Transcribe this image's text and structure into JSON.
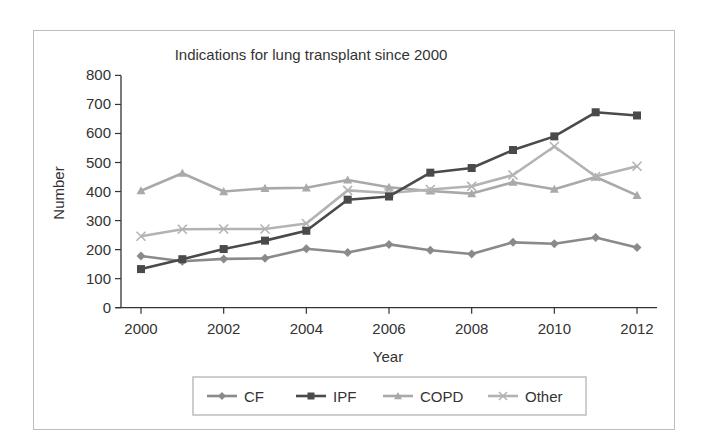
{
  "chart_data": {
    "type": "line",
    "title": "Indications for lung transplant since 2000",
    "xlabel": "Year",
    "ylabel": "Number",
    "x": [
      2000,
      2001,
      2002,
      2003,
      2004,
      2005,
      2006,
      2007,
      2008,
      2009,
      2010,
      2011,
      2012
    ],
    "x_tick_labels": [
      "2000",
      "2002",
      "2004",
      "2006",
      "2008",
      "2010",
      "2012"
    ],
    "y_tick_labels": [
      "0",
      "100",
      "200",
      "300",
      "400",
      "500",
      "600",
      "700",
      "800"
    ],
    "ylim": [
      0,
      800
    ],
    "xlim": [
      2000,
      2012
    ],
    "grid": false,
    "legend_position": "bottom",
    "series": [
      {
        "name": "CF",
        "marker": "diamond",
        "color": "#8a8a8a",
        "values": [
          178,
          160,
          168,
          170,
          203,
          190,
          218,
          198,
          185,
          225,
          220,
          242,
          207
        ]
      },
      {
        "name": "IPF",
        "marker": "square",
        "color": "#4a4a4a",
        "values": [
          133,
          167,
          202,
          231,
          265,
          372,
          383,
          465,
          481,
          543,
          590,
          673,
          662
        ]
      },
      {
        "name": "COPD",
        "marker": "triangle",
        "color": "#a9a9a9",
        "values": [
          403,
          463,
          400,
          411,
          413,
          440,
          415,
          402,
          393,
          432,
          408,
          450,
          387
        ]
      },
      {
        "name": "Other",
        "marker": "x",
        "color": "#b3b3b3",
        "values": [
          246,
          270,
          271,
          271,
          290,
          404,
          395,
          407,
          418,
          457,
          555,
          452,
          487
        ]
      }
    ]
  },
  "colors": {
    "axis": "#333333",
    "frame_border": "#bdbdbd",
    "legend_border": "#bdbdbd"
  }
}
